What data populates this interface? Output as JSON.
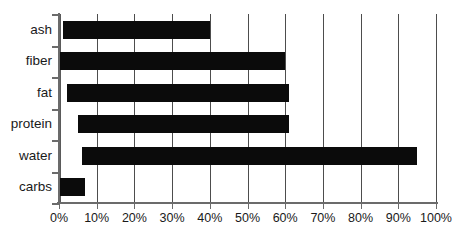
{
  "chart_data": {
    "type": "bar",
    "orientation": "horizontal",
    "title": "",
    "xlabel": "",
    "ylabel": "",
    "xlim": [
      0,
      100
    ],
    "xticks": [
      0,
      10,
      20,
      30,
      40,
      50,
      60,
      70,
      80,
      90,
      100
    ],
    "xtick_labels": [
      "0%",
      "10%",
      "20%",
      "30%",
      "40%",
      "50%",
      "60%",
      "70%",
      "80%",
      "90%",
      "100%"
    ],
    "grid": true,
    "legend": false,
    "bar_color": "#0b0b0b",
    "axis_color": "#6b6b6b",
    "grid_color": "#4d4d4d",
    "categories": [
      "ash",
      "fiber",
      "fat",
      "protein",
      "water",
      "carbs"
    ],
    "bars": [
      {
        "label": "ash",
        "start": 1,
        "end": 40,
        "value": 39
      },
      {
        "label": "fiber",
        "start": 0,
        "end": 60,
        "value": 60
      },
      {
        "label": "fat",
        "start": 2,
        "end": 61,
        "value": 59
      },
      {
        "label": "protein",
        "start": 5,
        "end": 61,
        "value": 56
      },
      {
        "label": "water",
        "start": 6,
        "end": 95,
        "value": 89
      },
      {
        "label": "carbs",
        "start": 0,
        "end": 7,
        "value": 7
      }
    ]
  }
}
